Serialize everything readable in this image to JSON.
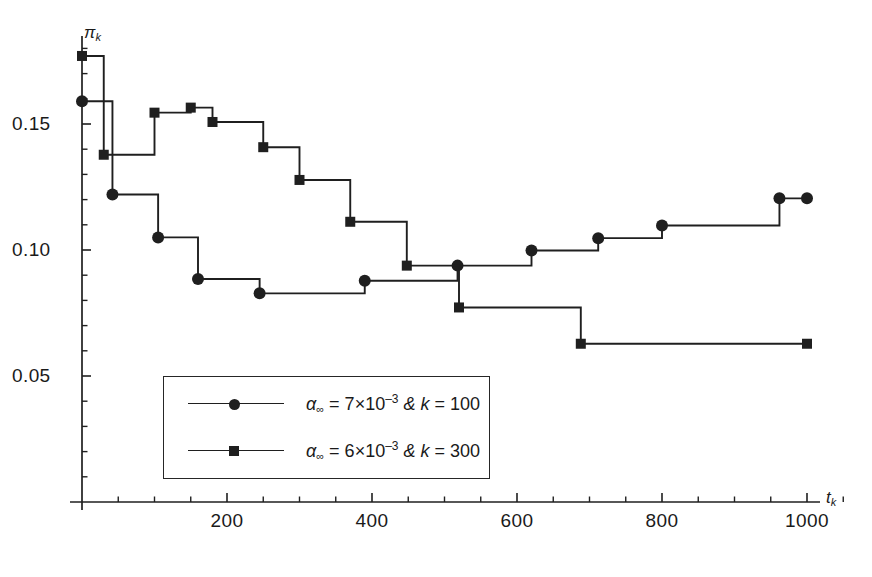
{
  "chart_data": {
    "type": "line",
    "title": "",
    "xlabel": "t_k",
    "ylabel": "pi_k",
    "xlim": [
      0,
      1050
    ],
    "ylim": [
      0,
      0.19
    ],
    "grid": false,
    "legend_position": "lower-left-inside",
    "x_ticks_major": [
      200,
      400,
      600,
      800,
      1000
    ],
    "x_tick_labels": [
      "200",
      "400",
      "600",
      "800",
      "1000"
    ],
    "x_ticks_minor": [
      50,
      100,
      150,
      250,
      300,
      350,
      450,
      500,
      550,
      650,
      700,
      750,
      850,
      900,
      950,
      1050
    ],
    "y_ticks_major": [
      0.05,
      0.1,
      0.15
    ],
    "y_tick_labels": [
      "0.05",
      "0.10",
      "0.15"
    ],
    "y_ticks_minor": [
      0.01,
      0.02,
      0.03,
      0.04,
      0.06,
      0.07,
      0.08,
      0.09,
      0.11,
      0.12,
      0.13,
      0.14,
      0.16,
      0.17,
      0.18
    ],
    "step_type": "post",
    "series": [
      {
        "name": "alpha_inf = 7x10^-3 & k = 100",
        "marker": "circle",
        "color": "#1f1f1f",
        "points": [
          {
            "x": 0,
            "y": 0.159
          },
          {
            "x": 42,
            "y": 0.122
          },
          {
            "x": 105,
            "y": 0.105
          },
          {
            "x": 160,
            "y": 0.0885
          },
          {
            "x": 245,
            "y": 0.0828
          },
          {
            "x": 390,
            "y": 0.0878
          },
          {
            "x": 518,
            "y": 0.0938
          },
          {
            "x": 620,
            "y": 0.0998
          },
          {
            "x": 712,
            "y": 0.1047
          },
          {
            "x": 800,
            "y": 0.1097
          },
          {
            "x": 962,
            "y": 0.1205
          },
          {
            "x": 1000,
            "y": 0.1205
          }
        ]
      },
      {
        "name": "alpha_inf = 6x10^-3 & k = 300",
        "marker": "square",
        "color": "#1f1f1f",
        "points": [
          {
            "x": 0,
            "y": 0.177
          },
          {
            "x": 30,
            "y": 0.1378
          },
          {
            "x": 100,
            "y": 0.1545
          },
          {
            "x": 150,
            "y": 0.1565
          },
          {
            "x": 180,
            "y": 0.1508
          },
          {
            "x": 250,
            "y": 0.1408
          },
          {
            "x": 300,
            "y": 0.1278
          },
          {
            "x": 370,
            "y": 0.1112
          },
          {
            "x": 448,
            "y": 0.0938
          },
          {
            "x": 520,
            "y": 0.0772
          },
          {
            "x": 688,
            "y": 0.0628
          },
          {
            "x": 1000,
            "y": 0.0628
          }
        ]
      }
    ],
    "legend": [
      {
        "marker": "circle",
        "alpha": "α",
        "alpha_sub": "∞",
        "eq1": " = 7×10",
        "exp": "–3",
        "amp": " & ",
        "k": "k",
        "eq2": " = 100"
      },
      {
        "marker": "square",
        "alpha": "α",
        "alpha_sub": "∞",
        "eq1": " = 6×10",
        "exp": "–3",
        "amp": " & ",
        "k": "k",
        "eq2": " = 300"
      }
    ]
  },
  "axis_labels": {
    "y_symbol": "π",
    "y_subscript": "k",
    "x_symbol": "t",
    "x_subscript": "k"
  }
}
